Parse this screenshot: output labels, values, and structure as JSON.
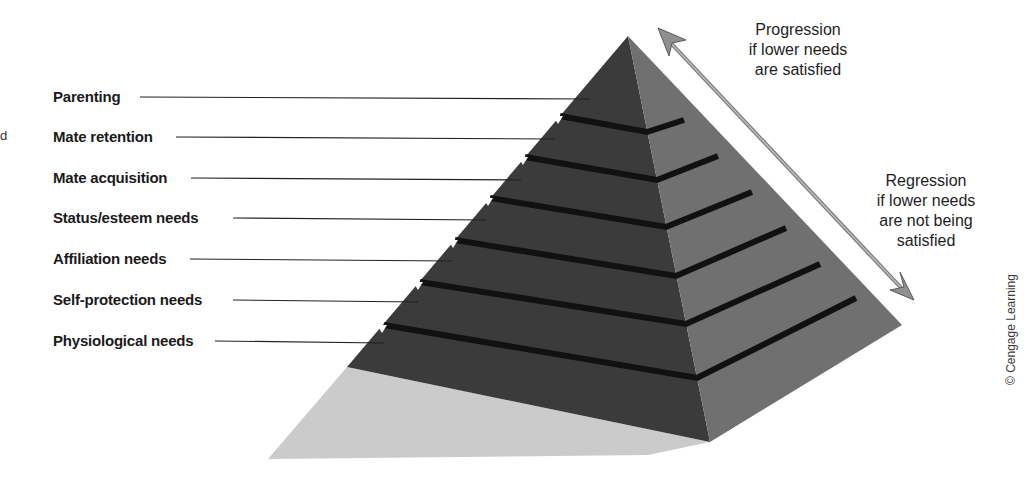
{
  "diagram": {
    "levels": [
      {
        "label": "Parenting",
        "y": 97,
        "line_end_x": 590
      },
      {
        "label": "Mate retention",
        "y": 137,
        "line_end_x": 555
      },
      {
        "label": "Mate acquisition",
        "y": 178,
        "line_end_x": 521
      },
      {
        "label": "Status/esteem needs",
        "y": 218,
        "line_end_x": 487
      },
      {
        "label": "Affiliation needs",
        "y": 259,
        "line_end_x": 452
      },
      {
        "label": "Self-protection needs",
        "y": 300,
        "line_end_x": 418
      },
      {
        "label": "Physiological needs",
        "y": 341,
        "line_end_x": 384
      }
    ],
    "progression_note": [
      "Progression",
      "if lower needs",
      "are satisfied"
    ],
    "regression_note": [
      "Regression",
      "if lower needs",
      "are not being",
      "satisfied"
    ],
    "copyright": "© Cengage Learning",
    "stray_fragment": "d",
    "colors": {
      "left_face": "#3a3a3a",
      "right_face": "#6e6e6e",
      "band": "#111111",
      "shadow": "#c9c9c9",
      "arrow": "#8a8a8a",
      "leader_line": "#222222"
    }
  }
}
